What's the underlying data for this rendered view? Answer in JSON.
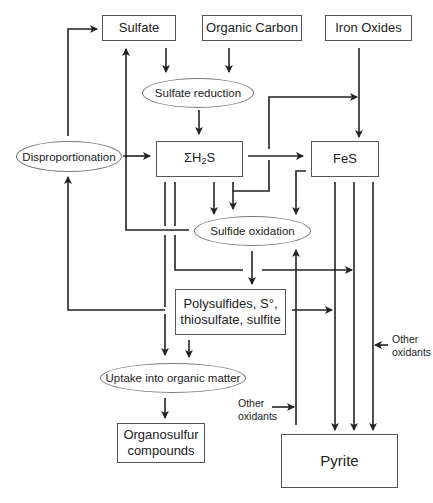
{
  "diagram": {
    "nodes": {
      "sulfate": "Sulfate",
      "organic_carbon": "Organic Carbon",
      "iron_oxides": "Iron Oxides",
      "sulfate_reduction": "Sulfate reduction",
      "disproportionation": "Disproportionation",
      "h2s_prefix": "ΣH",
      "h2s_sub": "2",
      "h2s_suffix": "S",
      "fes": "FeS",
      "sulfide_oxidation": "Sulfide oxidation",
      "intermediates_line1": "Polysulfides, S°,",
      "intermediates_line2": "thiosulfate, sulfite",
      "uptake": "Uptake into organic matter",
      "organosulfur_line1": "Organosulfur",
      "organosulfur_line2": "compounds",
      "pyrite": "Pyrite"
    },
    "labels": {
      "other_oxidants_right_1": "Other",
      "other_oxidants_right_2": "oxidants",
      "other_oxidants_left_1": "Other",
      "other_oxidants_left_2": "oxidants"
    },
    "colors": {
      "line": "#222222",
      "box_border": "#555555",
      "ellipse_border": "#777777"
    }
  }
}
